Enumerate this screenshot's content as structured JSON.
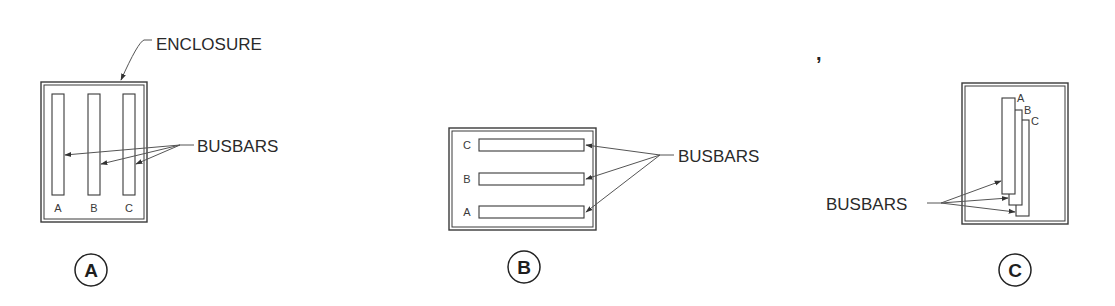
{
  "figure": {
    "panels": [
      {
        "id": "A",
        "badge": "A",
        "enclosure_label": "ENCLOSURE",
        "busbars_label": "BUSBARS",
        "orientation": "vertical side-by-side",
        "bar_labels": [
          "A",
          "B",
          "C"
        ]
      },
      {
        "id": "B",
        "badge": "B",
        "busbars_label": "BUSBARS",
        "orientation": "horizontal stacked",
        "bar_labels": [
          "C",
          "B",
          "A"
        ]
      },
      {
        "id": "C",
        "badge": "C",
        "busbars_label": "BUSBARS",
        "orientation": "vertical staggered / overlapping",
        "bar_labels": [
          "A",
          "B",
          "C"
        ]
      }
    ],
    "stray_mark": ","
  },
  "colors": {
    "line": "#3a3a3a",
    "text": "#2a2a2a",
    "background": "#ffffff"
  }
}
